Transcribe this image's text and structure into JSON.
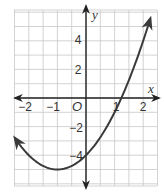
{
  "chart_data": {
    "type": "line",
    "title": "",
    "xlabel": "x",
    "ylabel": "y",
    "origin_label": "O",
    "xlim": [
      -2.5,
      2.5
    ],
    "ylim": [
      -6,
      6
    ],
    "grid": true,
    "x_grid_step": 0.5,
    "y_grid_step": 1,
    "x_ticks": [
      {
        "value": -2,
        "label": "−2"
      },
      {
        "value": -1,
        "label": "−1"
      },
      {
        "value": 1,
        "label": "1"
      },
      {
        "value": 2,
        "label": "2"
      }
    ],
    "y_ticks": [
      {
        "value": 4,
        "label": "4"
      },
      {
        "value": 2,
        "label": "2"
      },
      {
        "value": -2,
        "label": "−2"
      },
      {
        "value": -4,
        "label": "−4"
      }
    ],
    "series": [
      {
        "name": "parabola",
        "equation": "y = x^2 + 2x - 4",
        "vertex": [
          -1,
          -5
        ],
        "y_intercept": [
          0,
          -4
        ],
        "x_intercepts": [
          -3.24,
          1.24
        ],
        "domain_shown": [
          -2.49,
          2.25
        ],
        "points": [
          [
            -2.49,
            -2.78
          ],
          [
            -2.25,
            -3.44
          ],
          [
            -2.0,
            -4.0
          ],
          [
            -1.75,
            -4.44
          ],
          [
            -1.5,
            -4.75
          ],
          [
            -1.25,
            -4.94
          ],
          [
            -1.0,
            -5.0
          ],
          [
            -0.75,
            -4.94
          ],
          [
            -0.5,
            -4.75
          ],
          [
            -0.25,
            -4.44
          ],
          [
            0.0,
            -4.0
          ],
          [
            0.25,
            -3.44
          ],
          [
            0.5,
            -2.75
          ],
          [
            0.75,
            -1.94
          ],
          [
            1.0,
            -1.0
          ],
          [
            1.25,
            0.06
          ],
          [
            1.5,
            1.25
          ],
          [
            1.75,
            2.56
          ],
          [
            2.0,
            4.0
          ],
          [
            2.25,
            5.56
          ]
        ],
        "arrows_at_ends": true
      }
    ],
    "colors": {
      "grid": "#c8c8c8",
      "axes": "#222222",
      "curve": "#3a3a3a",
      "labels": "#333333"
    }
  }
}
